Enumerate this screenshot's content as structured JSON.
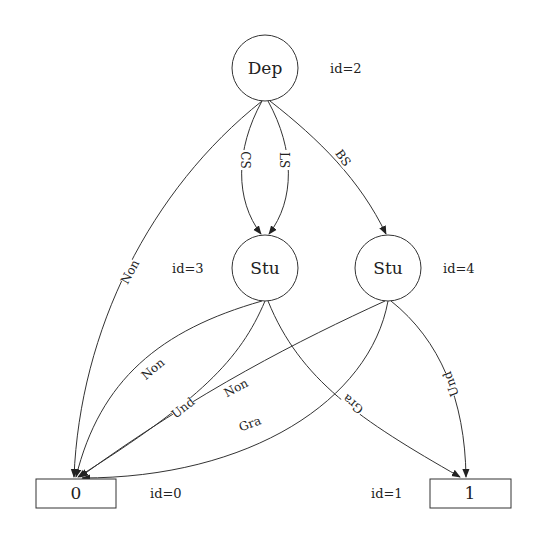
{
  "diagram": {
    "type": "decision-diagram",
    "nodes": [
      {
        "id": "2",
        "label": "Dep",
        "id_text": "id=2",
        "shape": "circle"
      },
      {
        "id": "3",
        "label": "Stu",
        "id_text": "id=3",
        "shape": "circle"
      },
      {
        "id": "4",
        "label": "Stu",
        "id_text": "id=4",
        "shape": "circle"
      },
      {
        "id": "0",
        "label": "0",
        "id_text": "id=0",
        "shape": "box"
      },
      {
        "id": "1",
        "label": "1",
        "id_text": "id=1",
        "shape": "box"
      }
    ],
    "edges": [
      {
        "from": "2",
        "to": "0",
        "label": "Non"
      },
      {
        "from": "2",
        "to": "3",
        "label": "CS"
      },
      {
        "from": "2",
        "to": "3",
        "label": "LS"
      },
      {
        "from": "2",
        "to": "4",
        "label": "BS"
      },
      {
        "from": "3",
        "to": "0",
        "label": "Non"
      },
      {
        "from": "3",
        "to": "0",
        "label": "Und"
      },
      {
        "from": "3",
        "to": "1",
        "label": "Gra"
      },
      {
        "from": "4",
        "to": "0",
        "label": "Non"
      },
      {
        "from": "4",
        "to": "0",
        "label": "Gra"
      },
      {
        "from": "4",
        "to": "1",
        "label": "Und"
      }
    ]
  }
}
